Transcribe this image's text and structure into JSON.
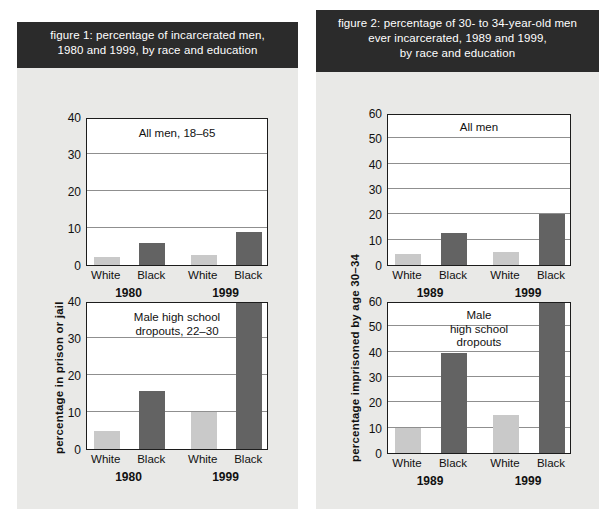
{
  "page": {
    "background": "#ffffff",
    "panel_background": "#e9e9e7",
    "title_background": "#2b2b2b",
    "title_color": "#ffffff",
    "bar_light_color": "#c9c9c9",
    "bar_dark_color": "#636363"
  },
  "figures": [
    {
      "id": "figure-1",
      "title": "figure 1: percentage of incarcerated men, 1980 and 1999, by race and education",
      "title_lines": [
        "figure 1: percentage of incarcerated men,",
        "1980 and 1999, by race and education"
      ],
      "ylabel": "percentage in prison or jail",
      "charts": [
        {
          "id": "figure-1-top",
          "caption": "All men, 18–65",
          "caption_lines": [
            "All men, 18–65"
          ],
          "yticks": [
            0,
            10,
            20,
            30,
            40
          ],
          "ylim": [
            0,
            40
          ],
          "groups": [
            "1980",
            "1999"
          ],
          "categories": [
            "White",
            "Black",
            "White",
            "Black"
          ],
          "values": [
            2.3,
            6.0,
            2.6,
            9.0
          ],
          "bar_styles": [
            "light",
            "dark",
            "light",
            "dark"
          ]
        },
        {
          "id": "figure-1-bottom",
          "caption": "Male high school dropouts, 22–30",
          "caption_lines": [
            "Male high school",
            "dropouts, 22–30"
          ],
          "yticks": [
            0,
            10,
            20,
            30,
            40
          ],
          "ylim": [
            0,
            40
          ],
          "groups": [
            "1980",
            "1999"
          ],
          "categories": [
            "White",
            "Black",
            "White",
            "Black"
          ],
          "values": [
            5.0,
            15.8,
            10.0,
            40.0
          ],
          "bar_styles": [
            "light",
            "dark",
            "light",
            "dark"
          ]
        }
      ]
    },
    {
      "id": "figure-2",
      "title": "figure 2: percentage of 30- to 34-year-old men ever incarcerated, 1989 and 1999, by race and education",
      "title_lines": [
        "figure 2: percentage of 30- to 34-year-old men",
        "ever incarcerated, 1989 and 1999,",
        "by race and education"
      ],
      "ylabel": "percentage imprisoned by age 30–34",
      "charts": [
        {
          "id": "figure-2-top",
          "caption": "All men",
          "caption_lines": [
            "All men"
          ],
          "yticks": [
            0,
            10,
            20,
            30,
            40,
            50,
            60
          ],
          "ylim": [
            0,
            60
          ],
          "groups": [
            "1989",
            "1999"
          ],
          "categories": [
            "White",
            "Black",
            "White",
            "Black"
          ],
          "values": [
            4.2,
            12.5,
            5.0,
            20.0
          ],
          "bar_styles": [
            "light",
            "dark",
            "light",
            "dark"
          ]
        },
        {
          "id": "figure-2-bottom",
          "caption": "Male high school dropouts",
          "caption_lines": [
            "Male",
            "high school",
            "dropouts"
          ],
          "yticks": [
            0,
            10,
            20,
            30,
            40,
            50,
            60
          ],
          "ylim": [
            0,
            60
          ],
          "groups": [
            "1989",
            "1999"
          ],
          "categories": [
            "White",
            "Black",
            "White",
            "Black"
          ],
          "values": [
            10.0,
            39.5,
            15.0,
            60.0
          ],
          "bar_styles": [
            "light",
            "dark",
            "light",
            "dark"
          ]
        }
      ]
    }
  ],
  "chart_data": [
    {
      "type": "bar",
      "id": "figure-1-top",
      "title": "figure 1: percentage of incarcerated men, 1980 and 1999, by race and education",
      "subtitle": "All men, 18–65",
      "xlabel": "",
      "ylabel": "percentage in prison or jail",
      "ylim": [
        0,
        40
      ],
      "yticks": [
        0,
        10,
        20,
        30,
        40
      ],
      "grid": true,
      "legend": "none",
      "categories": [
        "White 1980",
        "Black 1980",
        "White 1999",
        "Black 1999"
      ],
      "values": [
        2.3,
        6.0,
        2.6,
        9.0
      ]
    },
    {
      "type": "bar",
      "id": "figure-1-bottom",
      "title": "figure 1: percentage of incarcerated men, 1980 and 1999, by race and education",
      "subtitle": "Male high school dropouts, 22–30",
      "xlabel": "",
      "ylabel": "percentage in prison or jail",
      "ylim": [
        0,
        40
      ],
      "yticks": [
        0,
        10,
        20,
        30,
        40
      ],
      "grid": true,
      "legend": "none",
      "categories": [
        "White 1980",
        "Black 1980",
        "White 1999",
        "Black 1999"
      ],
      "values": [
        5.0,
        15.8,
        10.0,
        40.0
      ],
      "notes": "Black 1999 bar reaches/exceeds the top of the 0–40 axis"
    },
    {
      "type": "bar",
      "id": "figure-2-top",
      "title": "figure 2: percentage of 30- to 34-year-old men ever incarcerated, 1989 and 1999, by race and education",
      "subtitle": "All men",
      "xlabel": "",
      "ylabel": "percentage imprisoned by age 30–34",
      "ylim": [
        0,
        60
      ],
      "yticks": [
        0,
        10,
        20,
        30,
        40,
        50,
        60
      ],
      "grid": true,
      "legend": "none",
      "categories": [
        "White 1989",
        "Black 1989",
        "White 1999",
        "Black 1999"
      ],
      "values": [
        4.2,
        12.5,
        5.0,
        20.0
      ]
    },
    {
      "type": "bar",
      "id": "figure-2-bottom",
      "title": "figure 2: percentage of 30- to 34-year-old men ever incarcerated, 1989 and 1999, by race and education",
      "subtitle": "Male high school dropouts",
      "xlabel": "",
      "ylabel": "percentage imprisoned by age 30–34",
      "ylim": [
        0,
        60
      ],
      "yticks": [
        0,
        10,
        20,
        30,
        40,
        50,
        60
      ],
      "grid": true,
      "legend": "none",
      "categories": [
        "White 1989",
        "Black 1989",
        "White 1999",
        "Black 1999"
      ],
      "values": [
        10.0,
        39.5,
        15.0,
        60.0
      ],
      "notes": "Black 1999 bar reaches the top of the 0–60 axis"
    }
  ]
}
